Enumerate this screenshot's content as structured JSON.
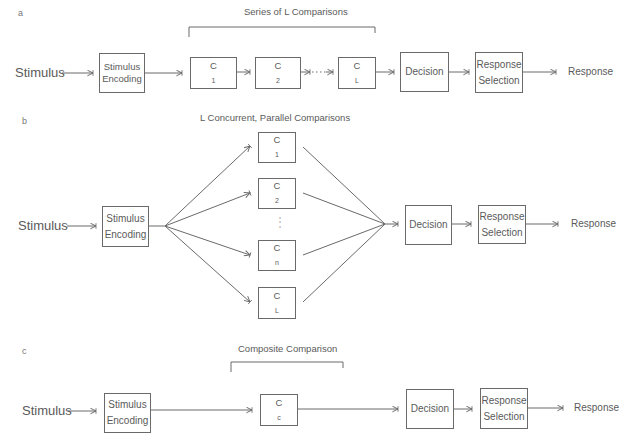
{
  "panels": {
    "a": {
      "label": "a",
      "title": "Series of L Comparisons",
      "input": "Stimulus",
      "encoding": {
        "line1": "Stimulus",
        "line2": "Encoding"
      },
      "comparisons": [
        {
          "base": "C",
          "sub": "1"
        },
        {
          "base": "C",
          "sub": "2"
        },
        {
          "base": "C",
          "sub": "L"
        }
      ],
      "ellipsis": "···",
      "decision": "Decision",
      "response_selection": {
        "line1": "Response",
        "line2": "Selection"
      },
      "output": "Response"
    },
    "b": {
      "label": "b",
      "title": "L Concurrent,  Parallel Comparisons",
      "input": "Stimulus",
      "encoding": {
        "line1": "Stimulus",
        "line2": "Encoding"
      },
      "comparisons": [
        {
          "base": "C",
          "sub": "1"
        },
        {
          "base": "C",
          "sub": "2"
        },
        {
          "base": "C",
          "sub": "n"
        },
        {
          "base": "C",
          "sub": "L"
        }
      ],
      "ellipsis": "⋮",
      "decision": "Decision",
      "response_selection": {
        "line1": "Response",
        "line2": "Selection"
      },
      "output": "Response"
    },
    "c": {
      "label": "c",
      "title": "Composite Comparison",
      "input": "Stimulus",
      "encoding": {
        "line1": "Stimulus",
        "line2": "Encoding"
      },
      "comparison": {
        "base": "C",
        "sub": "c"
      },
      "decision": "Decision",
      "response_selection": {
        "line1": "Response",
        "line2": "Selection"
      },
      "output": "Response"
    }
  },
  "colors": {
    "line": "#6a6a6a",
    "text": "#5a5a5a"
  }
}
